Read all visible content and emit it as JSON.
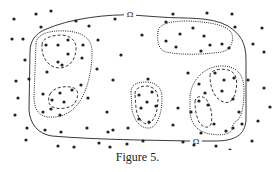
{
  "figure": {
    "caption": "Figure 5.",
    "omega_label_top": "Ω",
    "omega_label_bottom": "Ω",
    "colors": {
      "ink": "#222222",
      "background": "#ffffff"
    },
    "dot_radius": 1.6,
    "dots": [
      [
        14,
        19
      ],
      [
        36,
        14
      ],
      [
        51,
        11
      ],
      [
        41,
        27
      ],
      [
        12,
        39
      ],
      [
        23,
        39
      ],
      [
        25,
        60
      ],
      [
        16,
        81
      ],
      [
        76,
        21
      ],
      [
        89,
        26
      ],
      [
        115,
        19
      ],
      [
        142,
        35
      ],
      [
        173,
        14
      ],
      [
        207,
        13
      ],
      [
        232,
        14
      ],
      [
        235,
        27
      ],
      [
        262,
        28
      ],
      [
        98,
        40
      ],
      [
        121,
        55
      ],
      [
        148,
        79
      ],
      [
        166,
        41
      ],
      [
        188,
        73
      ],
      [
        253,
        44
      ],
      [
        264,
        52
      ],
      [
        29,
        79
      ],
      [
        62,
        65
      ],
      [
        47,
        72
      ],
      [
        82,
        58
      ],
      [
        43,
        94
      ],
      [
        18,
        98
      ],
      [
        15,
        115
      ],
      [
        27,
        128
      ],
      [
        26,
        140
      ],
      [
        45,
        130
      ],
      [
        61,
        132
      ],
      [
        87,
        128
      ],
      [
        108,
        132
      ],
      [
        128,
        128
      ],
      [
        139,
        119
      ],
      [
        97,
        69
      ],
      [
        113,
        80
      ],
      [
        107,
        112
      ],
      [
        113,
        130
      ],
      [
        173,
        125
      ],
      [
        178,
        108
      ],
      [
        191,
        112
      ],
      [
        201,
        133
      ],
      [
        88,
        98
      ],
      [
        81,
        85
      ],
      [
        248,
        80
      ],
      [
        264,
        88
      ],
      [
        270,
        107
      ],
      [
        258,
        121
      ],
      [
        252,
        141
      ],
      [
        230,
        150
      ],
      [
        216,
        146
      ],
      [
        58,
        146
      ],
      [
        74,
        147
      ],
      [
        99,
        143
      ],
      [
        110,
        147
      ],
      [
        127,
        144
      ],
      [
        143,
        141
      ],
      [
        183,
        142
      ],
      [
        194,
        145
      ],
      [
        199,
        101
      ],
      [
        46,
        45
      ],
      [
        58,
        45
      ],
      [
        68,
        40
      ],
      [
        68,
        54
      ],
      [
        58,
        62
      ],
      [
        83,
        45
      ],
      [
        60,
        93
      ],
      [
        72,
        90
      ],
      [
        52,
        100
      ],
      [
        64,
        102
      ],
      [
        43,
        112
      ],
      [
        51,
        109
      ],
      [
        60,
        115
      ],
      [
        139,
        95
      ],
      [
        152,
        92
      ],
      [
        147,
        102
      ],
      [
        156,
        106
      ],
      [
        141,
        108
      ],
      [
        149,
        122
      ],
      [
        166,
        22
      ],
      [
        180,
        34
      ],
      [
        193,
        28
      ],
      [
        204,
        36
      ],
      [
        176,
        47
      ],
      [
        201,
        51
      ],
      [
        210,
        45
      ],
      [
        222,
        44
      ],
      [
        229,
        48
      ],
      [
        215,
        73
      ],
      [
        224,
        80
      ],
      [
        234,
        78
      ],
      [
        222,
        91
      ],
      [
        233,
        99
      ],
      [
        199,
        84
      ],
      [
        205,
        93
      ],
      [
        208,
        105
      ],
      [
        214,
        124
      ],
      [
        226,
        131
      ],
      [
        233,
        128
      ],
      [
        239,
        112
      ],
      [
        242,
        124
      ]
    ]
  }
}
